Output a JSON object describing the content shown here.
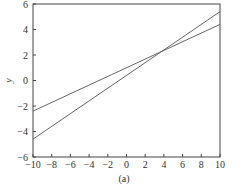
{
  "chart_data": {
    "type": "line",
    "title": "",
    "caption": "(a)",
    "xlabel": "x",
    "ylabel": "y",
    "xlim": [
      -10,
      10
    ],
    "ylim": [
      -6,
      6
    ],
    "xticks": [
      -10,
      -8,
      -6,
      -4,
      -2,
      0,
      2,
      4,
      6,
      8,
      10
    ],
    "yticks": [
      -6,
      -4,
      -2,
      0,
      2,
      4,
      6
    ],
    "grid": false,
    "legend": null,
    "x": [
      -10,
      10
    ],
    "series": [
      {
        "name": "line-1",
        "values": [
          -2.4,
          4.4
        ],
        "color": "#555555"
      },
      {
        "name": "line-2",
        "values": [
          -4.6,
          5.4
        ],
        "color": "#555555"
      }
    ]
  }
}
